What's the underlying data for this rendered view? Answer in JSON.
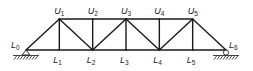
{
  "diagram": {
    "type": "pratt-truss",
    "panels": 6,
    "nodes": [
      {
        "id": "L0",
        "letter": "L",
        "index": "0",
        "chord": "bottom",
        "panel": 0
      },
      {
        "id": "L1",
        "letter": "L",
        "index": "1",
        "chord": "bottom",
        "panel": 1
      },
      {
        "id": "L2",
        "letter": "L",
        "index": "2",
        "chord": "bottom",
        "panel": 2
      },
      {
        "id": "L3",
        "letter": "L",
        "index": "3",
        "chord": "bottom",
        "panel": 3
      },
      {
        "id": "L4",
        "letter": "L",
        "index": "4",
        "chord": "bottom",
        "panel": 4
      },
      {
        "id": "L5",
        "letter": "L",
        "index": "5",
        "chord": "bottom",
        "panel": 5
      },
      {
        "id": "L6",
        "letter": "L",
        "index": "6",
        "chord": "bottom",
        "panel": 6
      },
      {
        "id": "U1",
        "letter": "U",
        "index": "1",
        "chord": "top",
        "panel": 1
      },
      {
        "id": "U2",
        "letter": "U",
        "index": "2",
        "chord": "top",
        "panel": 2
      },
      {
        "id": "U3",
        "letter": "U",
        "index": "3",
        "chord": "top",
        "panel": 3
      },
      {
        "id": "U4",
        "letter": "U",
        "index": "4",
        "chord": "top",
        "panel": 4
      },
      {
        "id": "U5",
        "letter": "U",
        "index": "5",
        "chord": "top",
        "panel": 5
      }
    ],
    "members": [
      [
        "L0",
        "L1"
      ],
      [
        "L1",
        "L2"
      ],
      [
        "L2",
        "L3"
      ],
      [
        "L3",
        "L4"
      ],
      [
        "L4",
        "L5"
      ],
      [
        "L5",
        "L6"
      ],
      [
        "U1",
        "U2"
      ],
      [
        "U2",
        "U3"
      ],
      [
        "U3",
        "U4"
      ],
      [
        "U4",
        "U5"
      ],
      [
        "L0",
        "U1"
      ],
      [
        "U5",
        "L6"
      ],
      [
        "U1",
        "L1"
      ],
      [
        "U2",
        "L2"
      ],
      [
        "U3",
        "L3"
      ],
      [
        "U4",
        "L4"
      ],
      [
        "U5",
        "L5"
      ],
      [
        "U1",
        "L2"
      ],
      [
        "L2",
        "U3"
      ],
      [
        "U3",
        "L4"
      ],
      [
        "L4",
        "U5"
      ]
    ],
    "supports": [
      {
        "node": "L0",
        "kind": "pin"
      },
      {
        "node": "L6",
        "kind": "roller"
      }
    ]
  }
}
